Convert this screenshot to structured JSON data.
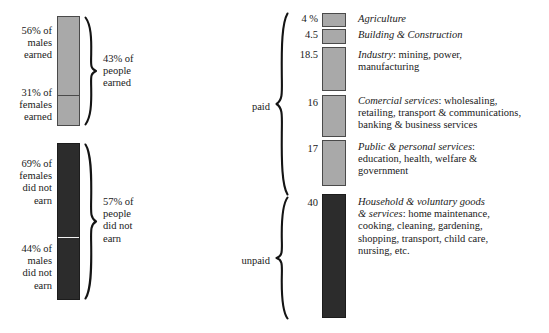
{
  "figure": {
    "type": "stacked-bar-diagram",
    "background": "#ffffff",
    "colors": {
      "paid_fill": "#a9a9a9",
      "unpaid_fill": "#2c2c2c",
      "outline": "#4a4a4a",
      "text": "#1a1a1a"
    }
  },
  "left_panel": {
    "name": "earned-vs-not-earned",
    "segments": [
      {
        "id": "males-earned",
        "label": "56% of\nmales\nearned",
        "value": 56,
        "shade": "light"
      },
      {
        "id": "females-earned",
        "label": "31% of\nfemales\nearned",
        "value": 31,
        "shade": "light"
      },
      {
        "id": "females-did-not-earn",
        "label": "69% of\nfemales\ndid not\nearn",
        "value": 69,
        "shade": "dark"
      },
      {
        "id": "males-did-not-earn",
        "label": "44% of\nmales\ndid not\nearn",
        "value": 44,
        "shade": "dark"
      }
    ],
    "braces": [
      {
        "id": "earned-brace",
        "label": "43% of\npeople\nearned",
        "value": 43
      },
      {
        "id": "did-not-earn-brace",
        "label": "57% of\npeople\ndid not\nearn",
        "value": 57
      }
    ],
    "label_lines": {
      "males_earned": [
        "56% of",
        "males",
        "earned"
      ],
      "females_earned": [
        "31% of",
        "females",
        "earned"
      ],
      "females_did_not": [
        "69% of",
        "females",
        "did not",
        "earn"
      ],
      "males_did_not": [
        "44% of",
        "males",
        "did not",
        "earn"
      ],
      "earned_total": [
        "43% of",
        "people",
        "earned"
      ],
      "did_not_earn_total": [
        "57% of",
        "people",
        "did not",
        "earn"
      ]
    }
  },
  "right_panel": {
    "name": "work-sector-breakdown",
    "group_labels": {
      "paid": "paid",
      "unpaid": "unpaid"
    },
    "rows": [
      {
        "id": "agriculture",
        "value": "4 %",
        "numeric": 4,
        "shade": "light",
        "group": "paid",
        "title": "Agriculture",
        "detail": ""
      },
      {
        "id": "building-construction",
        "value": "4.5",
        "numeric": 4.5,
        "shade": "light",
        "group": "paid",
        "title": "Building & Construction",
        "detail": ""
      },
      {
        "id": "industry",
        "value": "18.5",
        "numeric": 18.5,
        "shade": "light",
        "group": "paid",
        "title": "Industry",
        "detail": ": mining, power,\nmanufacturing",
        "detail_lines": [
          ": mining, power,",
          "manufacturing"
        ]
      },
      {
        "id": "comercial-services",
        "value": "16",
        "numeric": 16,
        "shade": "light",
        "group": "paid",
        "title": "Comercial services",
        "detail": ": wholesaling,\nretailing, transport & communications,\nbanking & business services",
        "detail_lines": [
          ": wholesaling,",
          "retailing, transport & communications,",
          "banking & business services"
        ]
      },
      {
        "id": "public-personal-services",
        "value": "17",
        "numeric": 17,
        "shade": "light",
        "group": "paid",
        "title": "Public & personal services",
        "detail": ":\neducation, health, welfare &\ngovernment",
        "detail_lines": [
          ":",
          "education, health, welfare &",
          "government"
        ]
      },
      {
        "id": "household-voluntary",
        "value": "40",
        "numeric": 40,
        "shade": "dark",
        "group": "unpaid",
        "title": "Household & voluntary goods",
        "title2": "& services",
        "detail": ": home maintenance,\ncooking, cleaning, gardening,\nshopping, transport, child care,\nnursing, etc.",
        "detail_lines": [
          ": home maintenance,",
          "cooking, cleaning, gardening,",
          "shopping, transport, child care,",
          "nursing, etc."
        ]
      }
    ]
  }
}
